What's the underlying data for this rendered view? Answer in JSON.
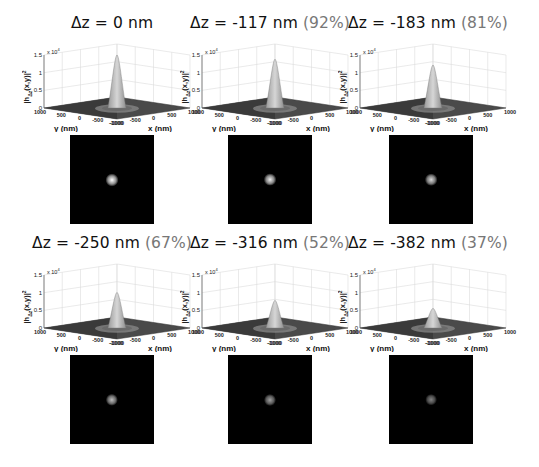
{
  "chart_data": {
    "type": "surface",
    "zlabel": "|h_Δz(x,y)|²",
    "zmultiplier": "x 10^4",
    "xlabel": "x (nm)",
    "ylabel": "y (nm)",
    "zlim": [
      0,
      1.5
    ],
    "zticks": [
      "0",
      "0.5",
      "1",
      "1.5"
    ],
    "xticks": [
      "-1000",
      "-500",
      "0",
      "500",
      "1000"
    ],
    "yticks": [
      "1000",
      "500",
      "0",
      "-500",
      "-1000"
    ],
    "grid": true,
    "panels": [
      {
        "dz": "Δz = 0 nm",
        "pct": "",
        "peak": 1.5,
        "relative": 100
      },
      {
        "dz": "Δz = -117 nm",
        "pct": "(92%)",
        "peak": 1.38,
        "relative": 92
      },
      {
        "dz": "Δz = -183 nm",
        "pct": "(81%)",
        "peak": 1.22,
        "relative": 81
      },
      {
        "dz": "Δz = -250 nm",
        "pct": "(67%)",
        "peak": 1.0,
        "relative": 67
      },
      {
        "dz": "Δz = -316 nm",
        "pct": "(52%)",
        "peak": 0.78,
        "relative": 52
      },
      {
        "dz": "Δz = -382 nm",
        "pct": "(37%)",
        "peak": 0.55,
        "relative": 37
      }
    ]
  },
  "labels": {
    "x_axis": "x (nm)",
    "y_axis": "y (nm)",
    "z_axis_main": "|h",
    "z_axis_sub": "Δz",
    "z_axis_rest": "(x,y)|",
    "z_axis_sup": "2",
    "z_mult": "x 10",
    "z_mult_exp": "4",
    "zt0": "0",
    "zt1": "0.5",
    "zt2": "1",
    "zt3": "1.5",
    "yt0": "1000",
    "yt1": "500",
    "yt2": "0",
    "yt3": "-500",
    "yt4": "-1000",
    "xt0": "-1000",
    "xt1": "-500",
    "xt2": "0",
    "xt3": "500",
    "xt4": "1000"
  },
  "panels": [
    {
      "dz": "Δz = 0 nm",
      "pct": ""
    },
    {
      "dz": "Δz = -117 nm",
      "pct": " (92%)"
    },
    {
      "dz": "Δz = -183 nm",
      "pct": " (81%)"
    },
    {
      "dz": "Δz = -250 nm",
      "pct": " (67%)"
    },
    {
      "dz": "Δz = -316 nm",
      "pct": " (52%)"
    },
    {
      "dz": "Δz = -382 nm",
      "pct": " (37%)"
    }
  ]
}
